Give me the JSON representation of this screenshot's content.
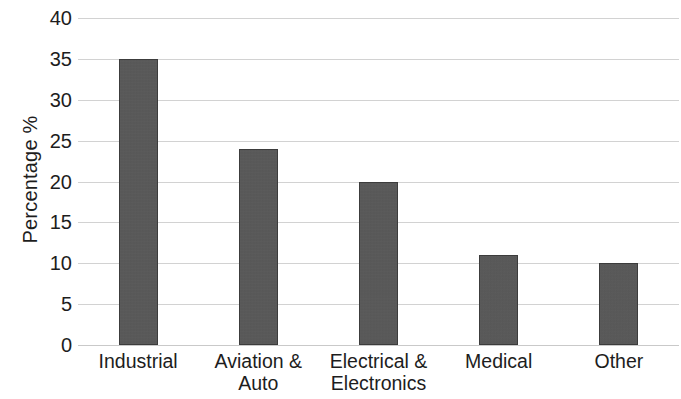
{
  "chart_data": {
    "type": "bar",
    "title": "",
    "subtitle": "",
    "xlabel": "",
    "ylabel": "Percentage %",
    "categories": [
      "Industrial",
      "Aviation & Auto",
      "Electrical & Electronics",
      "Medical",
      "Other"
    ],
    "values": [
      35,
      24,
      20,
      11,
      10
    ],
    "ylim": [
      0,
      40
    ],
    "y_ticks": [
      0,
      5,
      10,
      15,
      20,
      25,
      30,
      35,
      40
    ],
    "y_tick_labels": [
      "0",
      "5",
      "10",
      "15",
      "20",
      "25",
      "30",
      "35",
      "40"
    ],
    "grid": true,
    "grid_axis": "y",
    "legend": false,
    "legend_position": "none",
    "series": [
      {
        "name": "Percentage %",
        "values": [
          35,
          24,
          20,
          11,
          10
        ]
      }
    ],
    "colors": {
      "bar_fill": "#565656",
      "bar_border": "#3c3c3c",
      "gridline": "#d2d2d2",
      "text": "#1d1d1d",
      "background": "#ffffff"
    },
    "category_lines": [
      [
        "Industrial"
      ],
      [
        "Aviation &",
        "Auto"
      ],
      [
        "Electrical &",
        "Electronics"
      ],
      [
        "Medical"
      ],
      [
        "Other"
      ]
    ]
  }
}
